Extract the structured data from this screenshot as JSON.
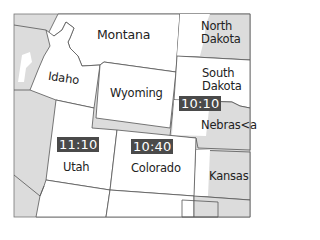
{
  "map": {
    "colors": {
      "background": "#ffffff",
      "state_fill": "#ffffff",
      "other_fill": "#dcdcdc",
      "border": "#555555",
      "badge_bg": "#4a4a4a",
      "badge_text": "#ffffff"
    },
    "states": [
      {
        "name": "Montana"
      },
      {
        "name": "North Dakota",
        "line1": "North",
        "line2": "Dakota"
      },
      {
        "name": "Idaho"
      },
      {
        "name": "South Dakota",
        "line1": "South",
        "line2": "Dakota"
      },
      {
        "name": "Wyoming"
      },
      {
        "name": "Nebraska",
        "display": "Nebras<a"
      },
      {
        "name": "Utah"
      },
      {
        "name": "Colorado"
      },
      {
        "name": "Kansas"
      }
    ],
    "times": [
      {
        "state": "South Dakota/Nebraska",
        "value": "10:10"
      },
      {
        "state": "Utah",
        "value": "11:10"
      },
      {
        "state": "Colorado",
        "value": "10:40"
      }
    ]
  }
}
